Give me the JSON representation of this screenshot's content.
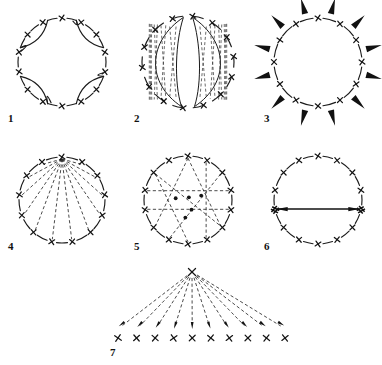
{
  "figure": {
    "width": 382,
    "height": 365,
    "background_color": "#ffffff",
    "ink_color": "#1b1b1b",
    "dash_color": "#2a2a2a"
  },
  "panels": [
    {
      "id": "panel-1",
      "label": "1",
      "label_x": 8,
      "label_y": 122,
      "center_x": 62,
      "center_y": 62,
      "radius": 44,
      "marker_count": 14,
      "marker_size": 7,
      "marker_rotation_offset": 0,
      "style": "circle-with-inward-lobes",
      "lobe_count": 4,
      "lobe_angles": [
        225,
        315,
        45,
        135
      ],
      "lobe_depth": 0.62,
      "description": "Circle of X markers with four inward-curving hook arcs forming a cloverleaf"
    },
    {
      "id": "panel-2",
      "label": "2",
      "label_x": 134,
      "label_y": 122,
      "center_x": 188,
      "center_y": 62,
      "radius": 46,
      "marker_count": 14,
      "marker_size": 7,
      "marker_rotation_offset": 6,
      "style": "circle-with-hatched-lenses",
      "lens_count": 2,
      "lens_tilt_deg": 8,
      "hatch_line_count": 9,
      "description": "Circle of X markers containing two vertical lens shapes filled with dashed hatching"
    },
    {
      "id": "panel-3",
      "label": "3",
      "label_x": 264,
      "label_y": 122,
      "center_x": 318,
      "center_y": 62,
      "radius": 44,
      "marker_count": 12,
      "marker_size": 7,
      "marker_rotation_offset": 0,
      "style": "circle-with-outward-arrows",
      "arrow_count": 12,
      "arrow_length": 16,
      "arrow_gap": 6,
      "arrow_rotation_offset": 15,
      "description": "Circle of X markers with twelve solid arrows radiating outward"
    },
    {
      "id": "panel-4",
      "label": "4",
      "label_x": 8,
      "label_y": 250,
      "center_x": 62,
      "center_y": 200,
      "radius": 43,
      "marker_count": 13,
      "marker_size": 7,
      "marker_rotation_offset": 0,
      "style": "circle-with-apex-fan",
      "apex_index": 0,
      "description": "Circle of X markers with dashed lines fanning from the top apex to every other marker"
    },
    {
      "id": "panel-5",
      "label": "5",
      "label_x": 134,
      "label_y": 250,
      "center_x": 188,
      "center_y": 200,
      "radius": 44,
      "marker_count": 14,
      "marker_size": 7,
      "marker_rotation_offset": 0,
      "style": "circle-with-crossing-chords",
      "chords": [
        [
          0,
          5
        ],
        [
          0,
          9
        ],
        [
          2,
          8
        ],
        [
          3,
          11
        ],
        [
          12,
          5
        ],
        [
          12,
          7
        ],
        [
          1,
          6
        ],
        [
          10,
          4
        ]
      ],
      "node_dot_count": 5,
      "description": "Circle of X markers with crossing dashed chords meeting at small filled nodes"
    },
    {
      "id": "panel-6",
      "label": "6",
      "label_x": 264,
      "label_y": 250,
      "center_x": 318,
      "center_y": 200,
      "radius": 44,
      "marker_count": 14,
      "marker_size": 7,
      "marker_rotation_offset": 0,
      "style": "circle-with-double-arrow",
      "arrow_left_index": 10,
      "arrow_right_index": 4,
      "heavy_marker_indices": [
        10,
        4
      ],
      "heavy_marker_strokes": 4,
      "description": "Circle of X markers with a double-headed arrow between two heavy hatched markers"
    },
    {
      "id": "panel-7",
      "label": "7",
      "label_x": 110,
      "label_y": 356,
      "apex_x": 192,
      "apex_y": 272,
      "baseline_y": 338,
      "baseline_start_x": 118,
      "baseline_end_x": 285,
      "marker_count": 10,
      "marker_size": 8,
      "style": "apex-fan-to-row",
      "description": "Single apex X with dashed arrows fanning down to a row of ten X markers"
    }
  ]
}
